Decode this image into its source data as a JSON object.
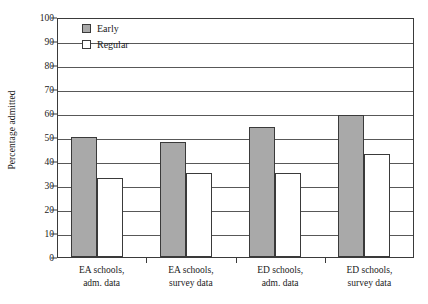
{
  "chart_data": {
    "type": "bar",
    "title": "",
    "xlabel": "",
    "ylabel": "Percentage admitted",
    "ylim": [
      0,
      100
    ],
    "yticks": [
      0,
      10,
      20,
      30,
      40,
      50,
      60,
      70,
      80,
      90,
      100
    ],
    "grid": true,
    "legend_position": "top-left-inside",
    "categories": [
      "EA schools, adm. data",
      "EA schools, survey data",
      "ED schools, adm. data",
      "ED schools, survey data"
    ],
    "category_lines": [
      [
        "EA schools,",
        "adm. data"
      ],
      [
        "EA schools,",
        "survey data"
      ],
      [
        "ED schools,",
        "adm. data"
      ],
      [
        "ED schools,",
        "survey data"
      ]
    ],
    "series": [
      {
        "name": "Early",
        "color": "#a9a9a9",
        "values": [
          50,
          48,
          54,
          59
        ]
      },
      {
        "name": "Regular",
        "color": "#ffffff",
        "values": [
          33,
          35,
          35,
          43
        ]
      }
    ]
  },
  "legend": {
    "items": [
      {
        "label": "Early",
        "swatch": "filled-gray-square"
      },
      {
        "label": "Regular",
        "swatch": "outlined-white-square"
      }
    ]
  },
  "axes": {
    "y_title": "Percentage admitted"
  },
  "colors": {
    "early_fill": "#a9a9a9",
    "regular_fill": "#ffffff",
    "outline": "#3a3a3a",
    "gridline": "#585858",
    "background": "#ffffff"
  }
}
